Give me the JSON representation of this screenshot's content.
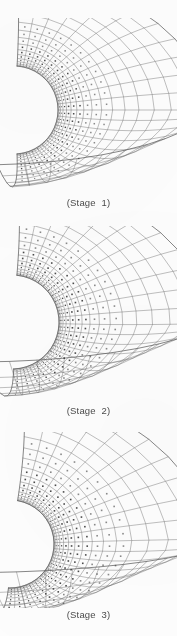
{
  "figure": {
    "name": "deformed-finite-element-mesh-stages",
    "background_color": "#fdfdfd",
    "line_color": "#5f5f5f",
    "marker_color": "#2b2b2b",
    "caption_color": "#3a3a3a",
    "width": 177,
    "height": 636
  },
  "panels": [
    {
      "id": "stage-1",
      "caption": "(Stage  1)",
      "top": 18,
      "mesh_height": 178,
      "geometry": {
        "hole_center_x": 14,
        "hole_center_y": 92,
        "hole_radius": 44,
        "outer_radius": 196,
        "angle_start_deg": -86,
        "angle_end_deg": 86,
        "radial_divisions": 17,
        "circumferential_divisions": 22,
        "radial_bias": 2.35,
        "shear_top": 0.22,
        "shear_bottom": -0.52,
        "vertical_squash_top": 0.3,
        "vertical_squash_bottom": 0.72,
        "marker_radial_limit": 11,
        "marker_size": 1.5
      }
    },
    {
      "id": "stage-2",
      "caption": "(Stage  2)",
      "top": 226,
      "mesh_height": 178,
      "geometry": {
        "hole_center_x": 12,
        "hole_center_y": 96,
        "hole_radius": 47,
        "outer_radius": 200,
        "angle_start_deg": -88,
        "angle_end_deg": 84,
        "radial_divisions": 17,
        "circumferential_divisions": 22,
        "radial_bias": 2.5,
        "shear_top": 0.3,
        "shear_bottom": -0.62,
        "vertical_squash_top": 0.26,
        "vertical_squash_bottom": 0.8,
        "marker_radial_limit": 12,
        "marker_size": 1.6
      }
    },
    {
      "id": "stage-3",
      "caption": "(Stage  3)",
      "top": 432,
      "mesh_height": 176,
      "geometry": {
        "hole_center_x": 10,
        "hole_center_y": 112,
        "hole_radius": 44,
        "outer_radius": 205,
        "angle_start_deg": -92,
        "angle_end_deg": 80,
        "radial_divisions": 17,
        "circumferential_divisions": 22,
        "radial_bias": 2.7,
        "shear_top": 0.4,
        "shear_bottom": -0.7,
        "vertical_squash_top": 0.22,
        "vertical_squash_bottom": 0.86,
        "marker_radial_limit": 13,
        "marker_size": 1.6
      }
    }
  ],
  "chart_data": {
    "type": "diagram",
    "subtitle": "Progressive deformation shown in three load stages",
    "legend": [],
    "annotations": [
      "(Stage  1)",
      "(Stage  2)",
      "(Stage  3)"
    ],
    "series": [
      {
        "name": "Stage 1",
        "hole_radius": 44,
        "elements_radial": 17,
        "elements_circumferential": 22,
        "deformation_level": 1
      },
      {
        "name": "Stage 2",
        "hole_radius": 47,
        "elements_radial": 17,
        "elements_circumferential": 22,
        "deformation_level": 2
      },
      {
        "name": "Stage 3",
        "hole_radius": 44,
        "elements_radial": 17,
        "elements_circumferential": 22,
        "deformation_level": 3
      }
    ],
    "xlabel": "",
    "ylabel": "",
    "grid": false
  }
}
